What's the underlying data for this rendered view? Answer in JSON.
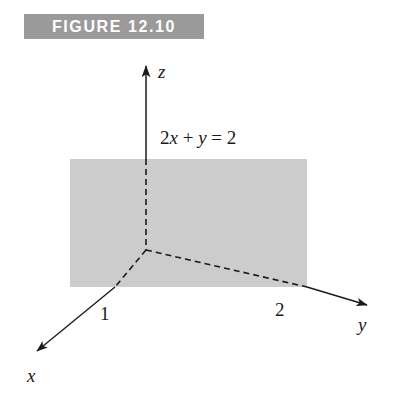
{
  "figure": {
    "banner_label": "FIGURE 12.10",
    "banner_color": "#9a9a9a",
    "banner_text_color": "#ffffff",
    "background_color": "#ffffff"
  },
  "diagram": {
    "type": "3d-coordinate-axes-with-plane",
    "plane_fill_color": "#cccccc",
    "line_color": "#1a1a1a",
    "equation": {
      "full": "2x + y = 2",
      "part_coefficient": "2",
      "part_x": "x",
      "part_plus": " + ",
      "part_y": "y",
      "part_equals": " = 2"
    },
    "axes": [
      {
        "name": "x-axis",
        "label": "x",
        "label_x": 27,
        "label_y": 382,
        "origin": [
          146,
          250
        ],
        "tip": [
          33,
          355
        ],
        "arrow": true
      },
      {
        "name": "y-axis",
        "label": "y",
        "label_x": 358,
        "label_y": 331,
        "origin": [
          146,
          250
        ],
        "tip": [
          371,
          307
        ],
        "arrow": true
      },
      {
        "name": "z-axis",
        "label": "z",
        "label_x": 158,
        "label_y": 78,
        "origin": [
          146,
          250
        ],
        "tip": [
          146,
          62
        ],
        "arrow": true
      }
    ],
    "ticks": [
      {
        "name": "x-intercept",
        "label": "1",
        "x": 100,
        "y": 320
      },
      {
        "name": "y-intercept",
        "label": "2",
        "x": 275,
        "y": 316
      }
    ],
    "plane_rect": {
      "x": 70,
      "y": 159,
      "width": 237,
      "height": 128
    },
    "origin_point": {
      "x": 146,
      "y": 250
    }
  }
}
